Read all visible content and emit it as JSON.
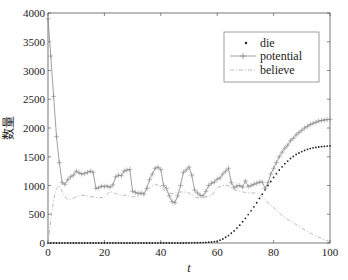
{
  "chart_data": {
    "type": "line",
    "title": "",
    "xlabel": "t",
    "ylabel": "数量",
    "xlim": [
      0,
      100
    ],
    "ylim": [
      0,
      4000
    ],
    "xticks": [
      0,
      20,
      40,
      60,
      80,
      100
    ],
    "yticks": [
      0,
      500,
      1000,
      1500,
      2000,
      2500,
      3000,
      3500,
      4000
    ],
    "grid": false,
    "legend_position": "upper right",
    "series": [
      {
        "name": "die",
        "style": "dots",
        "color": "#222222",
        "x": [
          0,
          2,
          4,
          6,
          8,
          10,
          12,
          14,
          16,
          18,
          20,
          22,
          24,
          26,
          28,
          30,
          32,
          34,
          36,
          38,
          40,
          42,
          44,
          46,
          48,
          50,
          52,
          54,
          56,
          58,
          60,
          62,
          64,
          66,
          68,
          70,
          72,
          74,
          76,
          78,
          80,
          82,
          84,
          86,
          88,
          90,
          92,
          94,
          96,
          98,
          100
        ],
        "values": [
          0,
          0,
          0,
          0,
          0,
          0,
          0,
          0,
          0,
          0,
          0,
          0,
          0,
          0,
          0,
          0,
          0,
          0,
          0,
          0,
          0,
          0,
          0,
          0,
          0,
          2,
          4,
          6,
          10,
          18,
          30,
          70,
          130,
          210,
          310,
          430,
          560,
          700,
          850,
          1000,
          1140,
          1270,
          1380,
          1470,
          1540,
          1590,
          1630,
          1655,
          1670,
          1680,
          1690
        ]
      },
      {
        "name": "potential",
        "style": "line-plus",
        "color": "#888888",
        "x": [
          0,
          1,
          2,
          3,
          4,
          5,
          6,
          7,
          8,
          9,
          10,
          11,
          12,
          13,
          14,
          15,
          16,
          17,
          18,
          19,
          20,
          21,
          22,
          23,
          24,
          25,
          26,
          27,
          28,
          29,
          30,
          31,
          32,
          33,
          34,
          35,
          36,
          37,
          38,
          39,
          40,
          41,
          42,
          43,
          44,
          45,
          46,
          47,
          48,
          49,
          50,
          51,
          52,
          53,
          54,
          55,
          56,
          57,
          58,
          59,
          60,
          61,
          62,
          63,
          64,
          65,
          66,
          67,
          68,
          69,
          70,
          71,
          72,
          73,
          74,
          75,
          76,
          77,
          78,
          79,
          80,
          81,
          82,
          83,
          84,
          85,
          86,
          87,
          88,
          89,
          90,
          91,
          92,
          93,
          94,
          95,
          96,
          97,
          98,
          99,
          100
        ],
        "values": [
          3900,
          3250,
          2550,
          1850,
          1400,
          1050,
          1020,
          1100,
          1150,
          1180,
          1250,
          1220,
          1200,
          1210,
          1230,
          1250,
          1230,
          950,
          960,
          990,
          980,
          990,
          970,
          1010,
          1150,
          1180,
          1170,
          1250,
          1270,
          1280,
          900,
          880,
          860,
          870,
          850,
          950,
          1100,
          1200,
          1300,
          1320,
          1280,
          1000,
          950,
          820,
          720,
          700,
          820,
          1000,
          1230,
          1270,
          1320,
          1180,
          920,
          870,
          830,
          820,
          900,
          1000,
          1040,
          1060,
          1110,
          1130,
          1200,
          1250,
          1300,
          1050,
          960,
          990,
          1000,
          970,
          1080,
          980,
          1000,
          1020,
          1040,
          1060,
          1060,
          950,
          1050,
          1200,
          1300,
          1400,
          1500,
          1580,
          1650,
          1700,
          1780,
          1820,
          1880,
          1920,
          1960,
          2000,
          2030,
          2060,
          2080,
          2100,
          2120,
          2130,
          2140,
          2145,
          2150
        ]
      },
      {
        "name": "believe",
        "style": "dash-dot",
        "color": "#aaaaaa",
        "x": [
          0,
          1,
          2,
          3,
          4,
          5,
          6,
          7,
          8,
          9,
          10,
          12,
          14,
          16,
          18,
          20,
          22,
          24,
          26,
          28,
          30,
          32,
          34,
          36,
          38,
          40,
          42,
          44,
          46,
          48,
          50,
          52,
          54,
          56,
          58,
          60,
          62,
          64,
          66,
          68,
          70,
          72,
          74,
          76,
          78,
          80,
          82,
          84,
          86,
          88,
          90,
          92,
          94,
          96,
          98,
          100
        ],
        "values": [
          0,
          400,
          750,
          950,
          1000,
          900,
          800,
          760,
          760,
          780,
          800,
          830,
          820,
          800,
          790,
          790,
          900,
          860,
          830,
          830,
          800,
          820,
          880,
          960,
          1020,
          980,
          880,
          860,
          880,
          890,
          870,
          800,
          780,
          800,
          820,
          960,
          1000,
          1000,
          930,
          900,
          880,
          870,
          870,
          810,
          700,
          620,
          520,
          440,
          380,
          320,
          260,
          200,
          150,
          100,
          60,
          20
        ]
      }
    ]
  },
  "legend": {
    "items": [
      {
        "label": "die"
      },
      {
        "label": "potential"
      },
      {
        "label": "believe"
      }
    ]
  },
  "axes": {
    "xlabel": "t",
    "ylabel": "数量",
    "xtick_labels": [
      "0",
      "20",
      "40",
      "60",
      "80",
      "100"
    ],
    "ytick_labels": [
      "0",
      "500",
      "1000",
      "1500",
      "2000",
      "2500",
      "3000",
      "3500",
      "4000"
    ]
  }
}
